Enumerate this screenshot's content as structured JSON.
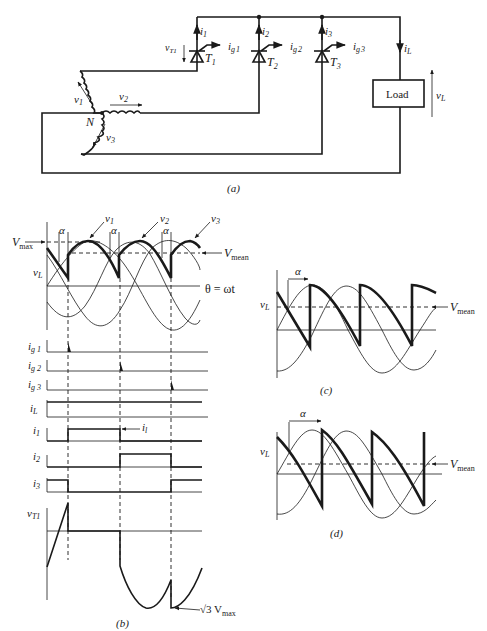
{
  "figure_a": {
    "caption": "(a)",
    "components": {
      "thyristors": [
        {
          "name": "T1",
          "label_main": "T",
          "label_sub": "1",
          "current": "i1",
          "gate": "ig1"
        },
        {
          "name": "T2",
          "label_main": "T",
          "label_sub": "2",
          "current": "i2",
          "gate": "ig2"
        },
        {
          "name": "T3",
          "label_main": "T",
          "label_sub": "3",
          "current": "i3",
          "gate": "ig3"
        }
      ],
      "load_label": "Load",
      "neutral_label": "N",
      "phase_voltages": [
        "v1",
        "v2",
        "v3"
      ],
      "load_current": "iL",
      "load_voltage": "vL",
      "thyristor_voltage": "vT1"
    },
    "labels": {
      "i": "i",
      "ig": "i",
      "g": "g",
      "s1": "1",
      "s2": "2",
      "s3": "3",
      "v": "v",
      "L": "L",
      "T1sub": "T1",
      "load": "Load",
      "N": "N"
    }
  },
  "figure_b": {
    "caption": "(b)",
    "labels": {
      "vmax": "V",
      "vmax_sub": "max",
      "vmean": "V",
      "vmean_sub": "mean",
      "alpha": "α",
      "theta": "θ = ωt",
      "vL": "v",
      "vL_sub": "L",
      "v1": "v",
      "v1_sub": "1",
      "v2": "v",
      "v2_sub": "2",
      "v3": "v",
      "v3_sub": "3",
      "ig1": "i",
      "ig1_sub": "g 1",
      "ig2": "i",
      "ig2_sub": "g 2",
      "ig3": "i",
      "ig3_sub": "g 3",
      "iL": "i",
      "iL_sub": "L",
      "i1": "i",
      "i1_sub": "1",
      "i2": "i",
      "i2_sub": "2",
      "i3": "i",
      "i3_sub": "3",
      "il_arrow": "i",
      "il_arrow_sub": "l",
      "vT1": "v",
      "vT1_sub": "T1",
      "sqrt3": "√3 V",
      "sqrt3_sub": "max"
    },
    "traces": [
      "vL",
      "ig1",
      "ig2",
      "ig3",
      "iL",
      "i1",
      "i2",
      "i3",
      "vT1"
    ]
  },
  "figure_c": {
    "caption": "(c)",
    "labels": {
      "vL": "v",
      "vL_sub": "L",
      "alpha": "α",
      "vmean": "V",
      "vmean_sub": "mean"
    }
  },
  "figure_d": {
    "caption": "(d)",
    "labels": {
      "vL": "v",
      "vL_sub": "L",
      "alpha": "α",
      "vmean": "V",
      "vmean_sub": "mean"
    }
  }
}
